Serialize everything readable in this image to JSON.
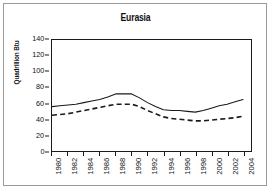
{
  "chart_data": {
    "type": "line",
    "title": "Eurasia",
    "xlabel": "",
    "ylabel": "Quadrillion Btu",
    "ylim": [
      0,
      140
    ],
    "ytick_labels": [
      "140",
      "120",
      "100",
      "80",
      "60",
      "40",
      "20",
      "0"
    ],
    "ytick_values": [
      140,
      120,
      100,
      80,
      60,
      40,
      20,
      0
    ],
    "xlim": [
      1980,
      2005
    ],
    "xtick_labels": [
      "1980",
      "1982",
      "1984",
      "1986",
      "1988",
      "1990",
      "1992",
      "1994",
      "1996",
      "1998",
      "2000",
      "2002",
      "2004"
    ],
    "xtick_values": [
      1980,
      1982,
      1984,
      1986,
      1988,
      1990,
      1992,
      1994,
      1996,
      1998,
      2000,
      2002,
      2004
    ],
    "grid": false,
    "legend": "none",
    "x": [
      1980,
      1981,
      1982,
      1983,
      1984,
      1985,
      1986,
      1987,
      1988,
      1989,
      1990,
      1991,
      1992,
      1993,
      1994,
      1995,
      1996,
      1997,
      1998,
      1999,
      2000,
      2001,
      2002,
      2003,
      2004
    ],
    "series": [
      {
        "name": "solid-line",
        "style": "solid",
        "color": "#1a1a1a",
        "values": [
          56,
          57,
          58,
          59,
          61,
          63,
          65,
          68,
          72,
          72,
          72,
          67,
          61,
          56,
          52,
          51,
          51,
          50,
          49,
          51,
          54,
          57,
          59,
          62,
          65
        ]
      },
      {
        "name": "dashed-line",
        "style": "dashed",
        "color": "#1a1a1a",
        "values": [
          45,
          46,
          47,
          49,
          51,
          53,
          55,
          57,
          59,
          59,
          59,
          56,
          51,
          47,
          43,
          41,
          40,
          39,
          38,
          38,
          39,
          40,
          41,
          42,
          44
        ]
      }
    ]
  },
  "colors": {
    "page_background": "#ffffff",
    "page_border": "#9a9a9a",
    "plot_border": "#1a1a1a",
    "text": "#111111",
    "line": "#1a1a1a"
  }
}
